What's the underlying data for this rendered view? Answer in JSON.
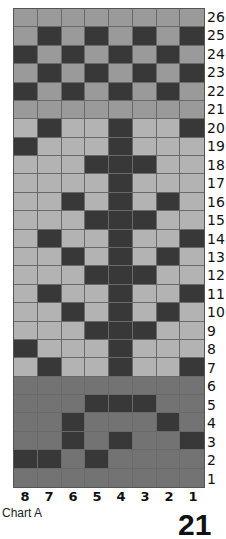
{
  "chart_data": {
    "type": "table",
    "title": "Chart A",
    "columns": [
      "8",
      "7",
      "6",
      "5",
      "4",
      "3",
      "2",
      "1"
    ],
    "rows_top_to_bottom": [
      26,
      25,
      24,
      23,
      22,
      21,
      20,
      19,
      18,
      17,
      16,
      15,
      14,
      13,
      12,
      11,
      10,
      9,
      8,
      7,
      6,
      5,
      4,
      3,
      2,
      1
    ],
    "legend": {
      "L": "light gray",
      "G": "mid gray",
      "M": "dark band gray",
      "D": "dark charcoal"
    },
    "colors": {
      "L": "#b3b3b3",
      "G": "#9a9a9a",
      "M": "#737373",
      "D": "#383838"
    },
    "grid": [
      "GGGGGGGG",
      "GDGDGDGD",
      "DGDGDGDG",
      "GDGDGDGD",
      "DGDGDGDG",
      "GGGGGGGG",
      "LDLLDLLD",
      "DLLLDLLL",
      "LLLDDDLL",
      "LLLLDLLL",
      "LLDLDLDL",
      "LLLDDDLL",
      "LDLLDLLD",
      "LLDLDLDL",
      "LLLDDDLL",
      "LDLLDLLD",
      "LLDLDLDL",
      "LLLDDDLL",
      "DLLLDLLL",
      "LDLLDLLD",
      "MMMMMMMM",
      "MMMDDDMM",
      "MMDMMMDM",
      "MMDMDMMD",
      "DDMDMMMM",
      "MMMMMMMM"
    ]
  },
  "caption": "Chart A",
  "page_number": "21"
}
